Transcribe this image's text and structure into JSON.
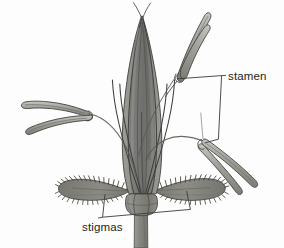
{
  "figure": {
    "kind": "botanical-diagram",
    "width": 284,
    "height": 248,
    "background_color": "#fdfdfd"
  },
  "labels": {
    "stamen": "stamen",
    "stigmas": "stigmas"
  },
  "colors": {
    "background": "#fdfdfd",
    "outline": "#3a3a38",
    "lemma_fill": "#7b7b79",
    "lemma_shadow": "#5f5f5d",
    "lemma_highlight": "#93938f",
    "palea_fill": "#8e8e8a",
    "filament_light": "#b9b9b4",
    "filament_mid": "#9a9a95",
    "anther_fill": "#a9a9a4",
    "anther_shadow": "#777772",
    "style_stroke": "#3f3f3d",
    "stigma_fill": "#82827e",
    "stigma_dark": "#5a5a57",
    "ovary_fill": "#8a8a86",
    "ovary_shadow": "#6b6b67",
    "stalk_fill": "#8b8b87",
    "leader_line": "#3b3b3b",
    "label_text": "#231f20"
  },
  "parts": [
    {
      "name": "lemma",
      "description": "large pointed gray bract forming the body of the floret"
    },
    {
      "name": "palea",
      "description": "inner bract visible behind the lemma"
    },
    {
      "name": "apical-hairs",
      "description": "two thin hair-like projections at the apex"
    },
    {
      "name": "stamen-upper-right",
      "description": "stamen with two elongated anther lobes pointing up and right"
    },
    {
      "name": "stamen-left",
      "description": "stamen with two anther lobes extending to the left"
    },
    {
      "name": "stamen-lower-right",
      "description": "stamen with anther lobes extending down and right"
    },
    {
      "name": "filament",
      "description": "slender stalk bearing an anther"
    },
    {
      "name": "stigma-left",
      "description": "feathery plumose stigma branch on the left"
    },
    {
      "name": "stigma-right",
      "description": "feathery plumose stigma branch on the right"
    },
    {
      "name": "style",
      "description": "thin dark thread connecting stigma to ovary"
    },
    {
      "name": "ovary",
      "description": "rounded swollen base of the floret"
    },
    {
      "name": "stalk",
      "description": "pedicel extending below the ovary to the image edge"
    }
  ],
  "leaders": [
    {
      "name": "stamen-bracket",
      "label": "stamen",
      "description": "bracket joining the upper-right stamen and the lower-right stamen to the stamen label",
      "label_x": 228,
      "label_y": 80
    },
    {
      "name": "stigmas-bracket",
      "label": "stigmas",
      "description": "bracket joining the left and right stigmas to the stigmas label",
      "label_x": 82,
      "label_y": 231
    }
  ]
}
